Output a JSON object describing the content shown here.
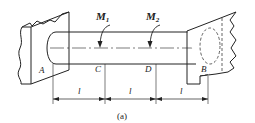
{
  "diagram": {
    "type": "shaft-with-fixed-ends",
    "caption": "(a)",
    "torques": [
      {
        "label": "M",
        "subscript": "1",
        "position": "C"
      },
      {
        "label": "M",
        "subscript": "2",
        "position": "D"
      }
    ],
    "points": {
      "A": "A",
      "B": "B",
      "C": "C",
      "D": "D"
    },
    "segments": [
      {
        "label": "l"
      },
      {
        "label": "l"
      },
      {
        "label": "l"
      }
    ],
    "colors": {
      "stroke": "#222222",
      "background": "#ffffff"
    }
  }
}
